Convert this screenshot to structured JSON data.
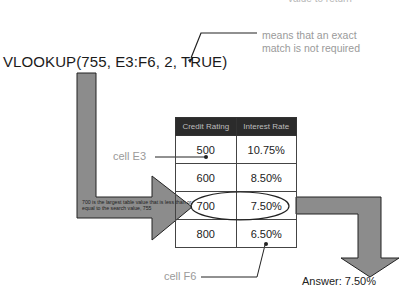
{
  "annotations": {
    "top_cut_note": "value to return",
    "exact_match_note_line1": "means that an exact",
    "exact_match_note_line2": "match is not required",
    "formula": "VLOOKUP(755, E3:F6, 2, TRUE)",
    "cell_e3_label": "cell E3",
    "cell_f6_label": "cell F6",
    "arrow_explanation": "700 is the largest table value that is less than or equal to the search value, 755",
    "answer": "Answer: 7.50%"
  },
  "table": {
    "headers": [
      "Credit Rating",
      "Interest Rate"
    ],
    "rows": [
      [
        "500",
        "10.75%"
      ],
      [
        "600",
        "8.50%"
      ],
      [
        "700",
        "7.50%"
      ],
      [
        "800",
        "6.50%"
      ]
    ],
    "highlighted_row": 2
  },
  "colors": {
    "arrow_fill": "#8c8c8c",
    "header_bg": "#2b2b2b",
    "note_text": "#9a9a9a"
  }
}
